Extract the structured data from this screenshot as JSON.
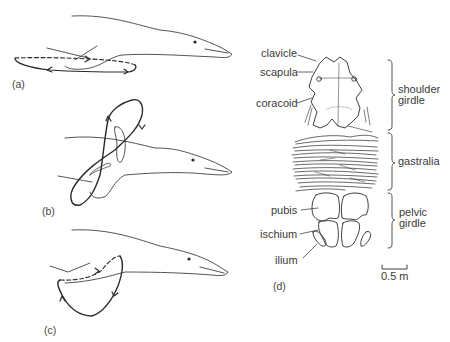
{
  "panels": {
    "a": {
      "label": "(a)"
    },
    "b": {
      "label": "(b)"
    },
    "c": {
      "label": "(c)"
    },
    "d": {
      "label": "(d)"
    }
  },
  "anatomy_labels": {
    "clavicle": "clavicle",
    "scapula": "scapula",
    "coracoid": "coracoid",
    "pubis": "pubis",
    "ischium": "ischium",
    "ilium": "ilium"
  },
  "regions": {
    "shoulder_line1": "shoulder",
    "shoulder_line2": "girdle",
    "gastralia": "gastralia",
    "pelvic_line1": "pelvic",
    "pelvic_line2": "girdle"
  },
  "scale_bar": {
    "label": "0.5 m"
  },
  "colors": {
    "ink": "#2a2a2a",
    "background": "#ffffff"
  }
}
